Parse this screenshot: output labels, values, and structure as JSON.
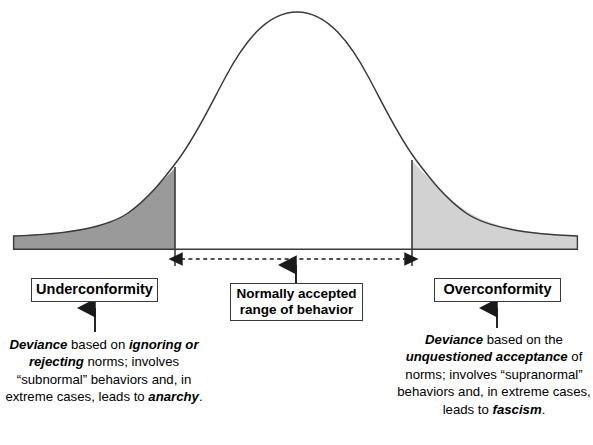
{
  "diagram": {
    "type": "normal-curve-annotated",
    "colors": {
      "curve_stroke": "#3a3a3a",
      "baseline_stroke": "#3a3a3a",
      "left_tail_fill": "#9a9a9a",
      "right_tail_fill": "#d2d2d2",
      "center_fill": "#ffffff",
      "text": "#000000",
      "box_border": "#3a3a3a",
      "page_background": "#ffffff"
    },
    "geometry": {
      "baseline_y": 249,
      "baseline_left_x": 13,
      "baseline_right_x": 578,
      "peak_x": 297,
      "peak_y": 12,
      "left_divider_x": 175,
      "right_divider_x": 412,
      "divider_bottom_y": 266,
      "tail_top_y": 236,
      "range_arrow_y": 259
    }
  },
  "labels": {
    "underconformity": "Underconformity",
    "overconformity": "Overconformity",
    "normal_range_line1": "Normally accepted",
    "normal_range_line2": "range of behavior"
  },
  "descriptions": {
    "left": {
      "segments": [
        {
          "text": "Deviance",
          "style": "bold-italic"
        },
        {
          "text": " based on ",
          "style": "normal"
        },
        {
          "text": "ignoring or rejecting",
          "style": "bold-italic"
        },
        {
          "text": " norms; involves “subnormal” behaviors and, in extreme cases, leads to ",
          "style": "normal"
        },
        {
          "text": "anarchy",
          "style": "bold-italic"
        },
        {
          "text": ".",
          "style": "normal"
        }
      ],
      "plain_text": "Deviance based on ignoring or rejecting norms; involves “subnormal” behaviors and, in extreme cases, leads to anarchy."
    },
    "right": {
      "segments": [
        {
          "text": "Deviance",
          "style": "bold-italic"
        },
        {
          "text": " based on the ",
          "style": "normal"
        },
        {
          "text": "unquestioned acceptance",
          "style": "bold-italic"
        },
        {
          "text": " of norms; involves “supranormal” behaviors and, in extreme cases, leads to ",
          "style": "normal"
        },
        {
          "text": "fascism",
          "style": "bold-italic"
        },
        {
          "text": ".",
          "style": "normal"
        }
      ],
      "plain_text": "Deviance based on the unquestioned acceptance of norms; involves “supranormal” behaviors and, in extreme cases, leads to fascism."
    }
  },
  "arrows": {
    "range_span": "double-headed-dashed-horizontal",
    "left_callout": "up-arrow",
    "right_callout": "up-arrow",
    "center_callout": "up-arrow"
  },
  "chart_data": {
    "type": "area",
    "xlabel": "",
    "ylabel": "",
    "regions": [
      {
        "name": "Underconformity",
        "x_from": 13,
        "x_to": 175,
        "fill": "#9a9a9a",
        "label": "Underconformity"
      },
      {
        "name": "Normally accepted range of behavior",
        "x_from": 175,
        "x_to": 412,
        "fill": "#ffffff",
        "label": "Normally accepted range of behavior"
      },
      {
        "name": "Overconformity",
        "x_from": 412,
        "x_to": 578,
        "fill": "#d2d2d2",
        "label": "Overconformity"
      }
    ],
    "curve": "bell",
    "grid": false,
    "legend": "none"
  }
}
